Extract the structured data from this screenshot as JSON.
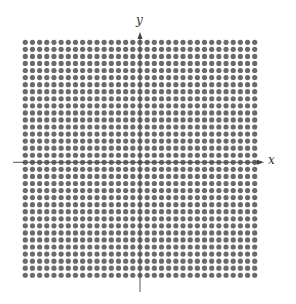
{
  "diagram": {
    "type": "lattice-grid",
    "axes": {
      "x_label": "x",
      "y_label": "y",
      "color": "#444444"
    },
    "grid": {
      "columns": 33,
      "rows": 34,
      "columns_left_of_y_axis": 16,
      "columns_right_of_y_axis": 16,
      "rows_above_x_axis": 17,
      "rows_below_x_axis": 16,
      "dot_color": "#6b6b6b",
      "dot_diameter_px": 5.2,
      "spacing_x_px": 7.17,
      "spacing_y_px": 7.06,
      "origin_px": [
        140,
        162.3
      ]
    }
  }
}
